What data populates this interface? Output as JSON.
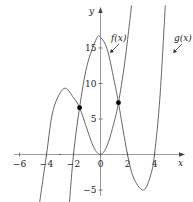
{
  "chart_data": {
    "type": "line",
    "title": "",
    "xlabel": "x",
    "ylabel": "y",
    "xlim": [
      -6.3,
      6.6
    ],
    "ylim": [
      -6.5,
      21.5
    ],
    "x_ticks": [
      -6,
      -4,
      -2,
      0,
      2,
      4
    ],
    "x_tick_labels": [
      "−6",
      "−4",
      "−2",
      "0",
      "2",
      "4"
    ],
    "y_ticks": [
      -5,
      5,
      10,
      15
    ],
    "y_tick_labels": [
      "−5",
      "5",
      "10",
      "15"
    ],
    "grid": false,
    "legend": "inline annotations with arrows",
    "series": [
      {
        "name": "f(x)",
        "label": "f(x)",
        "description": "zeros at x=-4 and x=0 (double), local max ≈ 9.3 near x≈-2.7, rises steeply for x>0",
        "points": [
          [
            -4.6,
            -8
          ],
          [
            -4,
            0
          ],
          [
            -3.5,
            6.3
          ],
          [
            -2.7,
            9.3
          ],
          [
            -2,
            8
          ],
          [
            -1.55,
            6.6
          ],
          [
            -1,
            3.6
          ],
          [
            -0.5,
            1
          ],
          [
            0,
            0
          ],
          [
            0.5,
            1.3
          ],
          [
            1,
            4.5
          ],
          [
            1.33,
            7.3
          ],
          [
            1.8,
            13
          ],
          [
            2.3,
            21
          ]
        ]
      },
      {
        "name": "g(x)",
        "label": "g(x)",
        "description": "zeros at x≈-2, 2, 4; local max ≈ 16.5 near x=0; local min ≈ -5 near x≈3.2",
        "points": [
          [
            -2.35,
            -8
          ],
          [
            -2,
            0
          ],
          [
            -1.55,
            6.6
          ],
          [
            -1,
            12.5
          ],
          [
            -0.3,
            16.3
          ],
          [
            0,
            16.5
          ],
          [
            0.5,
            14.8
          ],
          [
            1,
            10.5
          ],
          [
            1.33,
            7.3
          ],
          [
            2,
            0
          ],
          [
            2.5,
            -3.5
          ],
          [
            3.2,
            -5
          ],
          [
            3.7,
            -3
          ],
          [
            4,
            0
          ],
          [
            4.4,
            8
          ],
          [
            4.8,
            21
          ]
        ]
      }
    ],
    "intersections": [
      {
        "x": -1.55,
        "y": 6.6
      },
      {
        "x": 1.33,
        "y": 7.3
      }
    ],
    "annotations": [
      {
        "text": "f(x)",
        "position": [
          1.9,
          16.5
        ],
        "arrow_to": [
          1.5,
          12.5
        ]
      },
      {
        "text": "g(x)",
        "position": [
          6.4,
          16.5
        ],
        "arrow_to": [
          4.9,
          12.5
        ]
      }
    ]
  },
  "labels": {
    "x_axis": "x",
    "y_axis": "y",
    "f_label": "f(x)",
    "g_label": "g(x)"
  }
}
